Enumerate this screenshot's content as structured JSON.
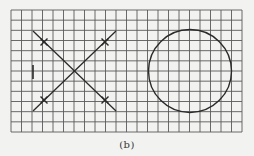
{
  "figure": {
    "caption": "(b)",
    "background_color": "#f2f2f0",
    "grid": {
      "x0": 11,
      "y0": 10,
      "x1": 242,
      "y1": 132,
      "columns": 22,
      "rows": 12,
      "line_color": "#5a5a5a"
    },
    "stroke_color": "#2a2a2a",
    "left_shape": {
      "type": "x-cross",
      "lines": [
        {
          "x1": 33,
          "y1": 31,
          "x2": 116,
          "y2": 111
        },
        {
          "x1": 116,
          "y1": 31,
          "x2": 33,
          "y2": 111
        }
      ],
      "markers": [
        {
          "x": 44,
          "y": 42
        },
        {
          "x": 105,
          "y": 42
        },
        {
          "x": 44,
          "y": 100
        },
        {
          "x": 105,
          "y": 100
        }
      ],
      "center": {
        "x": 74.5,
        "y": 71
      }
    },
    "tick_mark": {
      "x": 33,
      "y1": 65,
      "y2": 79
    },
    "right_shape": {
      "type": "circle",
      "cx": 190,
      "cy": 71,
      "r": 41.5
    }
  }
}
